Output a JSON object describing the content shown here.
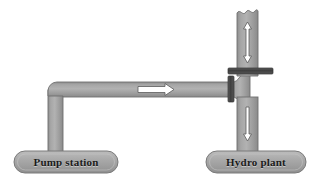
{
  "figure": {
    "background_color": "#ffffff"
  },
  "palette": {
    "pipe_fill": "#9a9a9a",
    "pipe_fill_light": "#b4b4b4",
    "pipe_edge": "#6f6f6f",
    "box_fill": "#a8a8a8",
    "box_edge": "#7a7a7a",
    "valve_dark": "#4a4a4a",
    "arrow_fill": "#ffffff",
    "arrow_edge": "#5a5a5a",
    "label_text": "#1a1a1a"
  },
  "stations": [
    {
      "id": "pump-station",
      "label": "Pump station",
      "x": 14,
      "y": 151,
      "width": 104,
      "height": 22
    },
    {
      "id": "hydro-plant",
      "label": "Hydro plant",
      "x": 206,
      "y": 151,
      "width": 100,
      "height": 22
    }
  ],
  "pipes": [
    {
      "id": "pump-riser",
      "orientation": "vertical",
      "description": "vertical pipe from pump station up to elbow"
    },
    {
      "id": "transfer-main",
      "orientation": "horizontal",
      "description": "horizontal transfer pipe from pump station to hydro plant"
    },
    {
      "id": "penstock-upper",
      "orientation": "vertical",
      "description": "upper vertical penstock with broken top edge"
    },
    {
      "id": "penstock-lower",
      "orientation": "vertical",
      "description": "lower vertical penstock down to hydro plant"
    }
  ],
  "flow_arrows": [
    {
      "id": "flow-arrow-horizontal",
      "direction": "right",
      "pipe": "transfer-main"
    },
    {
      "id": "flow-arrow-up",
      "direction": "up",
      "pipe": "penstock-upper"
    },
    {
      "id": "flow-arrow-down",
      "direction": "down",
      "pipe": "penstock-lower"
    }
  ],
  "valves": [
    {
      "id": "valve-horizontal-bar",
      "orientation": "horizontal",
      "description": "dark flange bar across upper penstock"
    },
    {
      "id": "valve-vertical-bar",
      "orientation": "vertical",
      "description": "dark valve bar across transfer main"
    }
  ]
}
